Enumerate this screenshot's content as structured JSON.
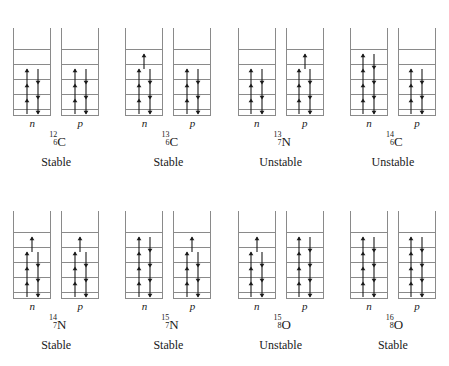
{
  "figure": {
    "well_axis_note": "open-topped potential well with discrete energy levels",
    "colors": {
      "well_line": "#8a8a8a",
      "level_line": "#8a8a8a",
      "arrow": "#1a1a1a",
      "text": "#1a1a1a",
      "background": "#ffffff"
    },
    "labels": {
      "neutron": "n",
      "proton": "p"
    },
    "stability_values": [
      "Stable",
      "Unstable"
    ],
    "level_capacity": 2,
    "levels_shown_per_well": 5
  },
  "chart_data": {
    "type": "diagram",
    "legend": [
      "n = neutron well",
      "p = proton well",
      "up arrow = spin up",
      "down arrow = spin down"
    ]
  },
  "nuclides": [
    {
      "mass_number": "12",
      "atomic_number": "6",
      "symbol": "C",
      "stability": "Stable",
      "neutron_label": "n",
      "proton_label": "p",
      "neutron_count": 6,
      "proton_count": 6,
      "neutron_levels": [
        2,
        2,
        2,
        0,
        0
      ],
      "proton_levels": [
        2,
        2,
        2,
        0,
        0
      ]
    },
    {
      "mass_number": "13",
      "atomic_number": "6",
      "symbol": "C",
      "stability": "Stable",
      "neutron_label": "n",
      "proton_label": "p",
      "neutron_count": 7,
      "proton_count": 6,
      "neutron_levels": [
        2,
        2,
        2,
        1,
        0
      ],
      "proton_levels": [
        2,
        2,
        2,
        0,
        0
      ]
    },
    {
      "mass_number": "13",
      "atomic_number": "7",
      "symbol": "N",
      "stability": "Unstable",
      "neutron_label": "n",
      "proton_label": "p",
      "neutron_count": 6,
      "proton_count": 7,
      "neutron_levels": [
        2,
        2,
        2,
        0,
        0
      ],
      "proton_levels": [
        2,
        2,
        2,
        1,
        0
      ]
    },
    {
      "mass_number": "14",
      "atomic_number": "6",
      "symbol": "C",
      "stability": "Unstable",
      "neutron_label": "n",
      "proton_label": "p",
      "neutron_count": 8,
      "proton_count": 6,
      "neutron_levels": [
        2,
        2,
        2,
        2,
        0
      ],
      "proton_levels": [
        2,
        2,
        2,
        0,
        0
      ]
    },
    {
      "mass_number": "14",
      "atomic_number": "7",
      "symbol": "N",
      "stability": "Stable",
      "neutron_label": "n",
      "proton_label": "p",
      "neutron_count": 7,
      "proton_count": 7,
      "neutron_levels": [
        2,
        2,
        2,
        1,
        0
      ],
      "proton_levels": [
        2,
        2,
        2,
        1,
        0
      ]
    },
    {
      "mass_number": "15",
      "atomic_number": "7",
      "symbol": "N",
      "stability": "Stable",
      "neutron_label": "n",
      "proton_label": "p",
      "neutron_count": 8,
      "proton_count": 7,
      "neutron_levels": [
        2,
        2,
        2,
        2,
        0
      ],
      "proton_levels": [
        2,
        2,
        2,
        1,
        0
      ]
    },
    {
      "mass_number": "15",
      "atomic_number": "8",
      "symbol": "O",
      "stability": "Unstable",
      "neutron_label": "n",
      "proton_label": "p",
      "neutron_count": 7,
      "proton_count": 8,
      "neutron_levels": [
        2,
        2,
        2,
        1,
        0
      ],
      "proton_levels": [
        2,
        2,
        2,
        2,
        0
      ]
    },
    {
      "mass_number": "16",
      "atomic_number": "8",
      "symbol": "O",
      "stability": "Stable",
      "neutron_label": "n",
      "proton_label": "p",
      "neutron_count": 8,
      "proton_count": 8,
      "neutron_levels": [
        2,
        2,
        2,
        2,
        0
      ],
      "proton_levels": [
        2,
        2,
        2,
        2,
        0
      ]
    }
  ]
}
